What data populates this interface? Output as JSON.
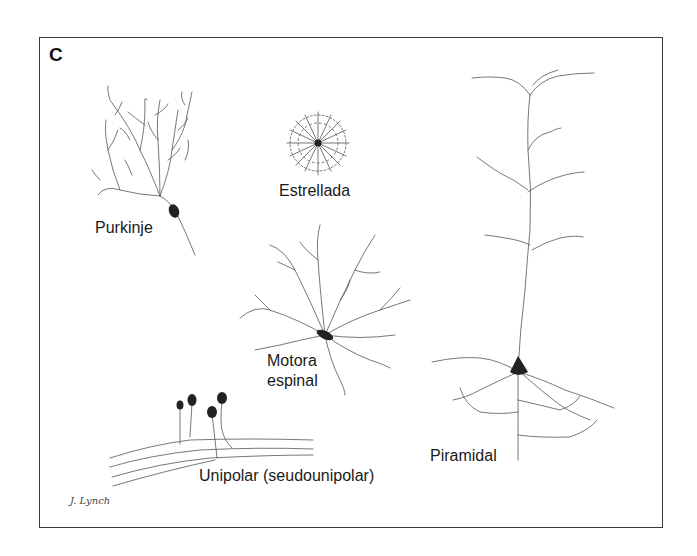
{
  "figure": {
    "panel_letter": "C",
    "labels": {
      "purkinje": "Purkinje",
      "estrellada": "Estrellada",
      "motora_line1": "Motora",
      "motora_line2": "espinal",
      "unipolar": "Unipolar (seudounipolar)",
      "piramidal": "Piramidal"
    },
    "signature": "J. Lynch",
    "colors": {
      "ink": "#3a3a3a",
      "soma": "#222222",
      "background": "#ffffff"
    }
  }
}
